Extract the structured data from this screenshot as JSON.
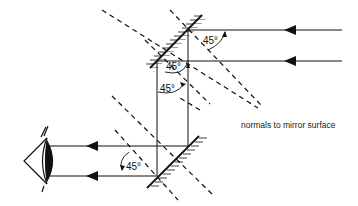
{
  "diagram": {
    "labels": {
      "angle_top_right": "45°",
      "angle_top_mid": "45°",
      "angle_top_lower": "45°",
      "angle_bottom": "45°",
      "normals_caption": "normals to mirror surface"
    },
    "colors": {
      "line": "#111111",
      "background": "#ffffff"
    }
  }
}
